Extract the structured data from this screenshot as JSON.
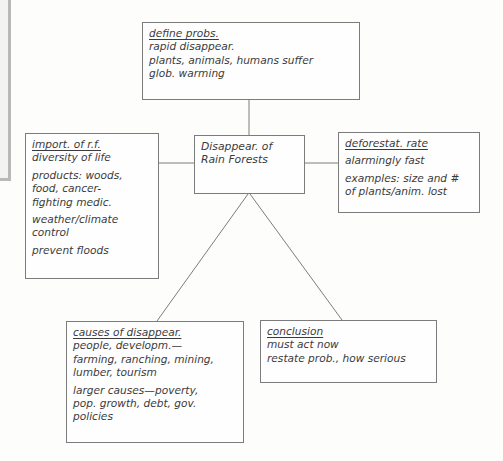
{
  "diagram": {
    "type": "cluster-map",
    "central_topic": {
      "lines": [
        "Disappear. of",
        "Rain Forests"
      ]
    },
    "branches": [
      {
        "id": "define",
        "heading": "define probs.",
        "groups": [
          [
            "rapid disappear.",
            "plants, animals, humans suffer",
            "glob. warming"
          ]
        ]
      },
      {
        "id": "importance",
        "heading": "import. of r.f.",
        "groups": [
          [
            "diversity of life"
          ],
          [
            "products: woods,",
            "food, cancer-",
            "fighting medic."
          ],
          [
            "weather/climate",
            "control"
          ],
          [
            "prevent floods"
          ]
        ]
      },
      {
        "id": "rate",
        "heading": "deforestat. rate",
        "groups": [
          [
            "alarmingly fast"
          ],
          [
            "examples: size and #",
            "of plants/anim. lost"
          ]
        ]
      },
      {
        "id": "causes",
        "heading": "causes of disappear.",
        "groups": [
          [
            "people, developm.—",
            "farming, ranching, mining,",
            "lumber, tourism"
          ],
          [
            "larger causes—poverty,",
            "pop. growth, debt, gov.",
            "policies"
          ]
        ]
      },
      {
        "id": "conclusion",
        "heading": "conclusion",
        "groups": [
          [
            "must act now",
            "restate prob., how serious"
          ]
        ]
      }
    ],
    "connections": [
      [
        "central",
        "define"
      ],
      [
        "central",
        "importance"
      ],
      [
        "central",
        "rate"
      ],
      [
        "central",
        "causes"
      ],
      [
        "central",
        "conclusion"
      ]
    ],
    "colors": {
      "line": "#7c7c7c",
      "text": "#3b3b3b",
      "frame": "#b9b9b9"
    }
  }
}
